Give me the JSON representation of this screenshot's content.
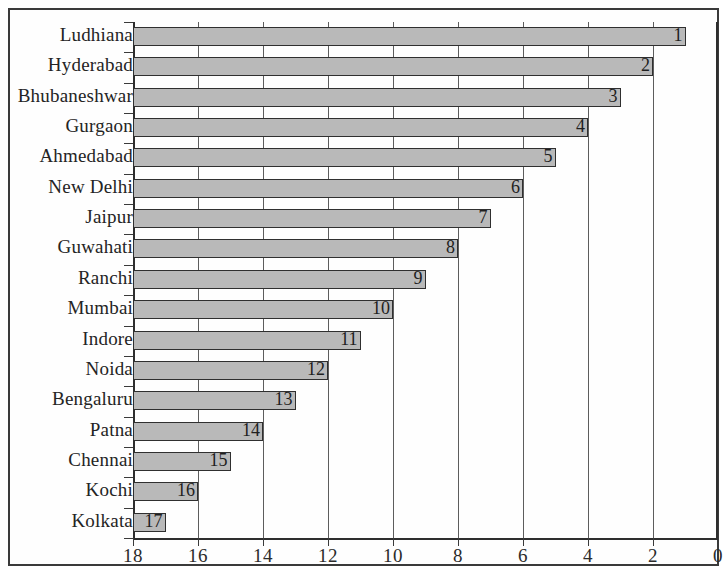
{
  "chart_data": {
    "type": "bar",
    "orientation": "horizontal",
    "title": "",
    "subtitle": "",
    "xlabel": "",
    "ylabel": "",
    "categories": [
      "Ludhiana",
      "Hyderabad",
      "Bhubaneshwar",
      "Gurgaon",
      "Ahmedabad",
      "New Delhi",
      "Jaipur",
      "Guwahati",
      "Ranchi",
      "Mumbai",
      "Indore",
      "Noida",
      "Bengaluru",
      "Patna",
      "Chennai",
      "Kochi",
      "Kolkata"
    ],
    "values": [
      1,
      2,
      3,
      4,
      5,
      6,
      7,
      8,
      9,
      10,
      11,
      12,
      13,
      14,
      15,
      16,
      17
    ],
    "data_labels": [
      "1",
      "2",
      "3",
      "4",
      "5",
      "6",
      "7",
      "8",
      "9",
      "10",
      "11",
      "12",
      "13",
      "14",
      "15",
      "16",
      "17"
    ],
    "xlim": [
      18,
      0
    ],
    "x_axis_reversed": true,
    "xticks": [
      18,
      16,
      14,
      12,
      10,
      8,
      6,
      4,
      2,
      0
    ],
    "xtick_labels": [
      "18",
      "16",
      "14",
      "12",
      "10",
      "8",
      "6",
      "4",
      "2",
      "0"
    ],
    "grid": true,
    "grid_axis": "x",
    "legend": false,
    "legend_position": "none",
    "bar_color": "#b9b9b9",
    "bar_border_color": "#2f2f2f",
    "axis_color": "#2e2e2e",
    "text_color": "#242424",
    "background_color": "#ffffff",
    "annotations": []
  }
}
